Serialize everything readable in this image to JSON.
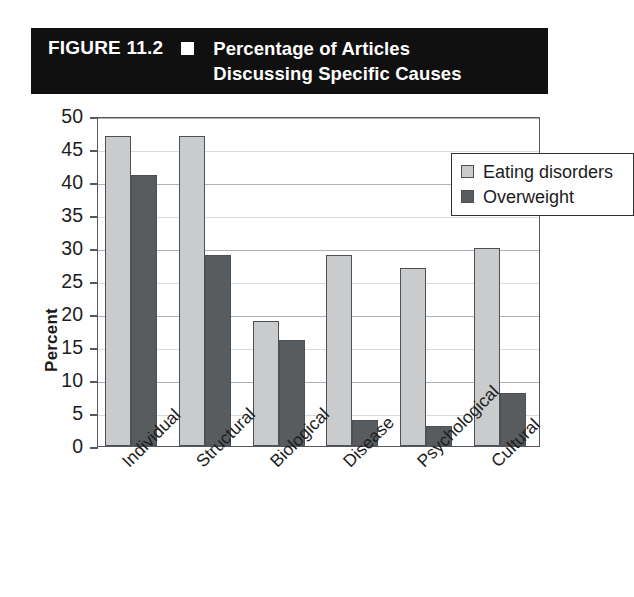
{
  "figure": {
    "number_label": "FIGURE 11.2",
    "marker_icon": "square-bullet-icon",
    "caption": "Percentage of Articles\nDiscussing Specific Causes"
  },
  "colors": {
    "banner_background": "#101010",
    "banner_text": "#ffffff",
    "series_eating_disorders": "#c9cbcc",
    "series_overweight": "#595c5f",
    "axis_line": "#55585c",
    "gridline": "#aeb2b6",
    "plot_background": "#ffffff"
  },
  "chart_data": {
    "type": "bar",
    "title": "Percentage of Articles Discussing Specific Causes",
    "subtitle": "",
    "xlabel": "",
    "ylabel": "Percent",
    "ylim": [
      0,
      50
    ],
    "ytick_step": 5,
    "yticks": [
      0,
      5,
      10,
      15,
      20,
      25,
      30,
      35,
      40,
      45,
      50
    ],
    "ytick_labels": [
      "0",
      "5",
      "10",
      "15",
      "20",
      "25",
      "30",
      "35",
      "40",
      "45",
      "50"
    ],
    "grid": true,
    "grid_axis": "y",
    "legend_position": "top-right",
    "categories": [
      "Individual",
      "Structural",
      "Biological",
      "Disease",
      "Psychological",
      "Cultural"
    ],
    "series": [
      {
        "name": "Eating disorders",
        "color": "#c9cbcc",
        "values": [
          47,
          47,
          19,
          29,
          27,
          30
        ]
      },
      {
        "name": "Overweight",
        "color": "#595c5f",
        "values": [
          41,
          29,
          16,
          4,
          3,
          8
        ]
      }
    ]
  }
}
